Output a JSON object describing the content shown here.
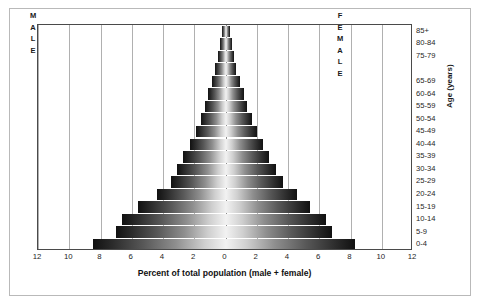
{
  "chart_data": {
    "type": "bar",
    "title": "",
    "subtitle": "",
    "xlabel": "Percent of total population (male + female)",
    "ylabel": "Age (years)",
    "orientation": "population-pyramid",
    "grid": true,
    "legend_position": "in-plot",
    "xlim": [
      -12,
      12
    ],
    "xticks": [
      12,
      10,
      8,
      6,
      4,
      2,
      0,
      2,
      4,
      6,
      8,
      10,
      12
    ],
    "xtick_values_signed": [
      -12,
      -10,
      -8,
      -6,
      -4,
      -2,
      0,
      2,
      4,
      6,
      8,
      10,
      12
    ],
    "categories": [
      "0-4",
      "5-9",
      "10-14",
      "15-19",
      "20-24",
      "25-29",
      "30-34",
      "35-39",
      "40-44",
      "45-49",
      "50-54",
      "55-59",
      "60-64",
      "65-69",
      "70-74",
      "75-79",
      "80-84",
      "85+"
    ],
    "age_tick_labels_shown": [
      "85+",
      "80-84",
      "75-79",
      "65-69",
      "60-64",
      "55-59",
      "50-54",
      "45-49",
      "40-44",
      "35-39",
      "30-34",
      "25-29",
      "20-24",
      "15-19",
      "10-14",
      "5-9",
      "0-4"
    ],
    "series": [
      {
        "name": "MALE",
        "side": "left",
        "values": [
          8.5,
          7.0,
          6.6,
          5.6,
          4.4,
          3.5,
          3.1,
          2.7,
          2.3,
          1.9,
          1.6,
          1.3,
          1.1,
          0.85,
          0.65,
          0.5,
          0.35,
          0.25
        ]
      },
      {
        "name": "FEMALE",
        "side": "right",
        "values": [
          8.3,
          6.8,
          6.4,
          5.4,
          4.6,
          3.7,
          3.2,
          2.8,
          2.4,
          2.0,
          1.7,
          1.4,
          1.2,
          0.95,
          0.7,
          0.55,
          0.4,
          0.3
        ]
      }
    ]
  },
  "labels": {
    "male_stack": [
      "M",
      "A",
      "L",
      "E"
    ],
    "female_stack": [
      "F",
      "E",
      "M",
      "A",
      "L",
      "E"
    ]
  },
  "colors": {
    "outer_frame": "#b9b9b9",
    "plot_frame": "#4a4a4a",
    "gridline": "#b0b0b0",
    "center_line": "#8d8d8d",
    "bar_dark": "#111111",
    "bar_light": "#f2f2f2",
    "text": "#1a1a1a",
    "background": "#ffffff"
  }
}
